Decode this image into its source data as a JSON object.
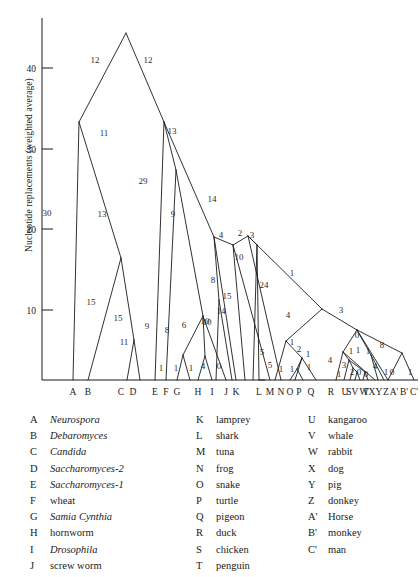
{
  "chart_data": {
    "type": "diagram",
    "subtype": "phylogenetic-tree",
    "title": "",
    "xlabel": "",
    "ylabel": "Nucleotide replacements (weighted average)",
    "ylim": [
      0,
      47
    ],
    "yticks": [
      10,
      20,
      30,
      40
    ],
    "grid": false,
    "legend_position": "below",
    "tips": [
      {
        "key": "A",
        "name": "Neurospora",
        "italic": true,
        "x": 73
      },
      {
        "key": "B",
        "name": "Debaromyces",
        "italic": true,
        "x": 88
      },
      {
        "key": "C",
        "name": "Candida",
        "italic": true,
        "x": 121
      },
      {
        "key": "D",
        "name": "Saccharomyces-2",
        "italic": true,
        "x": 133
      },
      {
        "key": "E",
        "name": "Saccharomyces-1",
        "italic": true,
        "x": 155
      },
      {
        "key": "F",
        "name": "wheat",
        "italic": false,
        "x": 166
      },
      {
        "key": "G",
        "name": "Samia Cynthia",
        "italic": true,
        "x": 177
      },
      {
        "key": "H",
        "name": "hornworm",
        "italic": false,
        "x": 198
      },
      {
        "key": "I",
        "name": "Drosophila",
        "italic": true,
        "x": 212
      },
      {
        "key": "J",
        "name": "screw worm",
        "italic": false,
        "x": 226
      },
      {
        "key": "K",
        "name": "lamprey",
        "italic": false,
        "x": 236
      },
      {
        "key": "L",
        "name": "shark",
        "italic": false,
        "x": 259
      },
      {
        "key": "M",
        "name": "tuna",
        "italic": false,
        "x": 270
      },
      {
        "key": "N",
        "name": "frog",
        "italic": false,
        "x": 281
      },
      {
        "key": "O",
        "name": "snake",
        "italic": false,
        "x": 290
      },
      {
        "key": "P",
        "name": "turtle",
        "italic": false,
        "x": 299
      },
      {
        "key": "Q",
        "name": "pigeon",
        "italic": false,
        "x": 311
      },
      {
        "key": "R",
        "name": "duck",
        "italic": false,
        "x": 331
      },
      {
        "key": "S",
        "name": "chicken",
        "italic": false,
        "x": 349
      },
      {
        "key": "T",
        "name": "penguin",
        "italic": false,
        "x": 366
      },
      {
        "key": "U",
        "name": "kangaroo",
        "italic": false,
        "x": 345
      },
      {
        "key": "V",
        "name": "whale",
        "italic": false,
        "x": 355
      },
      {
        "key": "W",
        "name": "rabbit",
        "italic": false,
        "x": 364
      },
      {
        "key": "X",
        "name": "dog",
        "italic": false,
        "x": 372
      },
      {
        "key": "Y",
        "name": "pig",
        "italic": false,
        "x": 379
      },
      {
        "key": "Z",
        "name": "donkey",
        "italic": false,
        "x": 386
      },
      {
        "key": "A'",
        "name": "Horse",
        "italic": false,
        "x": 394
      },
      {
        "key": "B'",
        "name": "monkey",
        "italic": false,
        "x": 404
      },
      {
        "key": "C'",
        "name": "man",
        "italic": false,
        "x": 414
      }
    ],
    "tip_axis_labels": [
      {
        "label": "A",
        "x": 73
      },
      {
        "label": "B",
        "x": 88
      },
      {
        "label": "C",
        "x": 121
      },
      {
        "label": "D",
        "x": 133
      },
      {
        "label": "E",
        "x": 155
      },
      {
        "label": "F",
        "x": 166
      },
      {
        "label": "G",
        "x": 177
      },
      {
        "label": "H",
        "x": 198
      },
      {
        "label": "I",
        "x": 212
      },
      {
        "label": "J",
        "x": 226
      },
      {
        "label": "K",
        "x": 236
      },
      {
        "label": "L",
        "x": 259
      },
      {
        "label": "M",
        "x": 270
      },
      {
        "label": "N",
        "x": 281
      },
      {
        "label": "O",
        "x": 290
      },
      {
        "label": "P",
        "x": 299
      },
      {
        "label": "Q",
        "x": 311
      },
      {
        "label": "R",
        "x": 331
      },
      {
        "label": "S",
        "x": 349
      },
      {
        "label": "T",
        "x": 366
      },
      {
        "label": "U",
        "x": 345
      },
      {
        "label": "V",
        "x": 355
      },
      {
        "label": "W",
        "x": 364
      },
      {
        "label": "X",
        "x": 372
      },
      {
        "label": "Y",
        "x": 379
      },
      {
        "label": "Z",
        "x": 386
      },
      {
        "label": "A'",
        "x": 394
      },
      {
        "label": "B'",
        "x": 404
      },
      {
        "label": "C'",
        "x": 414
      }
    ],
    "branch_lengths": [
      {
        "value": "12",
        "x": 95,
        "y": 63
      },
      {
        "value": "12",
        "x": 148,
        "y": 63
      },
      {
        "value": "11",
        "x": 104,
        "y": 136
      },
      {
        "value": "13",
        "x": 172,
        "y": 134
      },
      {
        "value": "30",
        "x": 47,
        "y": 216
      },
      {
        "value": "13",
        "x": 102,
        "y": 217
      },
      {
        "value": "29",
        "x": 143,
        "y": 184
      },
      {
        "value": "9",
        "x": 173,
        "y": 217
      },
      {
        "value": "14",
        "x": 212,
        "y": 202
      },
      {
        "value": "15",
        "x": 91,
        "y": 305
      },
      {
        "value": "15",
        "x": 118,
        "y": 321
      },
      {
        "value": "11",
        "x": 124,
        "y": 345
      },
      {
        "value": "9",
        "x": 147,
        "y": 329
      },
      {
        "value": "8",
        "x": 167,
        "y": 333
      },
      {
        "value": "6",
        "x": 184,
        "y": 328
      },
      {
        "value": "10",
        "x": 205,
        "y": 324
      },
      {
        "value": "8",
        "x": 213,
        "y": 283
      },
      {
        "value": "15",
        "x": 227,
        "y": 299
      },
      {
        "value": "14",
        "x": 221,
        "y": 314
      },
      {
        "value": "10",
        "x": 207,
        "y": 325
      },
      {
        "value": "4",
        "x": 221,
        "y": 238
      },
      {
        "value": "2",
        "x": 240,
        "y": 236
      },
      {
        "value": "3",
        "x": 252,
        "y": 238
      },
      {
        "value": "10",
        "x": 239,
        "y": 260
      },
      {
        "value": "24",
        "x": 264,
        "y": 288
      },
      {
        "value": "1",
        "x": 292,
        "y": 276
      },
      {
        "value": "4",
        "x": 288,
        "y": 318
      },
      {
        "value": "3",
        "x": 341,
        "y": 313
      },
      {
        "value": "5",
        "x": 262,
        "y": 355
      },
      {
        "value": "1",
        "x": 292,
        "y": 345
      },
      {
        "value": "2",
        "x": 299,
        "y": 352
      },
      {
        "value": "1",
        "x": 308,
        "y": 357
      },
      {
        "value": "5",
        "x": 270,
        "y": 368
      },
      {
        "value": "1",
        "x": 281,
        "y": 372
      },
      {
        "value": "1",
        "x": 292,
        "y": 372
      },
      {
        "value": "1",
        "x": 309,
        "y": 370
      },
      {
        "value": "4",
        "x": 330,
        "y": 363
      },
      {
        "value": "0",
        "x": 357,
        "y": 338
      },
      {
        "value": "1",
        "x": 358,
        "y": 353
      },
      {
        "value": "8",
        "x": 382,
        "y": 348
      },
      {
        "value": "3",
        "x": 344,
        "y": 368
      },
      {
        "value": "1",
        "x": 351,
        "y": 354
      },
      {
        "value": "1",
        "x": 368,
        "y": 354
      },
      {
        "value": "1",
        "x": 339,
        "y": 377
      },
      {
        "value": "2",
        "x": 352,
        "y": 375
      },
      {
        "value": "0",
        "x": 359,
        "y": 375
      },
      {
        "value": "0",
        "x": 366,
        "y": 377
      },
      {
        "value": "4",
        "x": 375,
        "y": 369
      },
      {
        "value": "1",
        "x": 386,
        "y": 375
      },
      {
        "value": "0",
        "x": 392,
        "y": 375
      },
      {
        "value": "1",
        "x": 410,
        "y": 375
      },
      {
        "value": "1",
        "x": 176,
        "y": 371
      },
      {
        "value": "1",
        "x": 191,
        "y": 371
      },
      {
        "value": "4",
        "x": 203,
        "y": 369
      },
      {
        "value": "0",
        "x": 219,
        "y": 369
      },
      {
        "value": "1",
        "x": 161,
        "y": 371
      }
    ]
  },
  "axis": {
    "ticks": [
      {
        "label": "40",
        "y": 68
      },
      {
        "label": "30",
        "y": 149
      },
      {
        "label": "20",
        "y": 229
      },
      {
        "label": "10",
        "y": 310
      }
    ],
    "ylabel": "Nucleotide replacements (weighted average)"
  },
  "legend": {
    "col1": [
      {
        "key": "A",
        "name": "Neurospora",
        "italic": true
      },
      {
        "key": "B",
        "name": "Debaromyces",
        "italic": true
      },
      {
        "key": "C",
        "name": "Candida",
        "italic": true
      },
      {
        "key": "D",
        "name": "Saccharomyces-2",
        "italic": true
      },
      {
        "key": "E",
        "name": "Saccharomyces-1",
        "italic": true
      },
      {
        "key": "F",
        "name": "wheat",
        "italic": false
      },
      {
        "key": "G",
        "name": "Samia Cynthia",
        "italic": true
      },
      {
        "key": "H",
        "name": "hornworm",
        "italic": false
      },
      {
        "key": "I",
        "name": "Drosophila",
        "italic": true
      },
      {
        "key": "J",
        "name": "screw worm",
        "italic": false
      }
    ],
    "col2": [
      {
        "key": "K",
        "name": "lamprey",
        "italic": false
      },
      {
        "key": "L",
        "name": "shark",
        "italic": false
      },
      {
        "key": "M",
        "name": "tuna",
        "italic": false
      },
      {
        "key": "N",
        "name": "frog",
        "italic": false
      },
      {
        "key": "O",
        "name": "snake",
        "italic": false
      },
      {
        "key": "P",
        "name": "turtle",
        "italic": false
      },
      {
        "key": "Q",
        "name": "pigeon",
        "italic": false
      },
      {
        "key": "R",
        "name": "duck",
        "italic": false
      },
      {
        "key": "S",
        "name": "chicken",
        "italic": false
      },
      {
        "key": "T",
        "name": "penguin",
        "italic": false
      }
    ],
    "col3": [
      {
        "key": "U",
        "name": "kangaroo",
        "italic": false
      },
      {
        "key": "V",
        "name": "whale",
        "italic": false
      },
      {
        "key": "W",
        "name": "rabbit",
        "italic": false
      },
      {
        "key": "X",
        "name": "dog",
        "italic": false
      },
      {
        "key": "Y",
        "name": "pig",
        "italic": false
      },
      {
        "key": "Z",
        "name": "donkey",
        "italic": false
      },
      {
        "key": "A'",
        "name": "Horse",
        "italic": false
      },
      {
        "key": "B'",
        "name": "monkey",
        "italic": false
      },
      {
        "key": "C'",
        "name": "man",
        "italic": false
      }
    ]
  },
  "colors": {
    "ink": "#1a1a1a",
    "background": "#ffffff"
  }
}
